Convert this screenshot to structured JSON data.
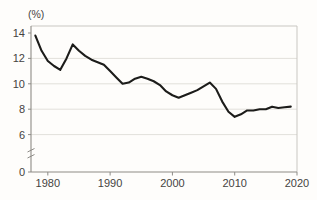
{
  "chart_data": {
    "type": "line",
    "title": "",
    "subtitle": "",
    "xlabel": "",
    "ylabel": "",
    "unit_label": "(%)",
    "grid": true,
    "legend": null,
    "xlim": [
      1977.3,
      2020.0
    ],
    "ylim": [
      5.0,
      14.6
    ],
    "yaxis_break": true,
    "yaxis_break_note": "axis broken between 0 and 6",
    "y_ticks": [
      0,
      6,
      8,
      10,
      12,
      14
    ],
    "y_tick_labels": [
      "0",
      "6",
      "8",
      "10",
      "12",
      "14"
    ],
    "x_ticks": [
      1980,
      1990,
      2000,
      2010,
      2020
    ],
    "x_tick_labels": [
      "1980",
      "1990",
      "2000",
      "2010",
      "2020"
    ],
    "series": [
      {
        "name": "rate",
        "color": "#1c1c1a",
        "x": [
          1978,
          1979,
          1980,
          1981,
          1982,
          1983,
          1984,
          1985,
          1986,
          1987,
          1988,
          1989,
          1990,
          1991,
          1992,
          1993,
          1994,
          1995,
          1996,
          1997,
          1998,
          1999,
          2000,
          2001,
          2002,
          2003,
          2004,
          2005,
          2006,
          2007,
          2008,
          2009,
          2010,
          2011,
          2012,
          2013,
          2014,
          2015,
          2016,
          2017,
          2018,
          2019
        ],
        "values": [
          13.8,
          12.6,
          11.8,
          11.4,
          11.1,
          12.0,
          13.1,
          12.6,
          12.2,
          11.9,
          11.7,
          11.5,
          11.0,
          10.5,
          10.0,
          10.1,
          10.4,
          10.55,
          10.4,
          10.2,
          9.9,
          9.4,
          9.1,
          8.9,
          9.1,
          9.3,
          9.5,
          9.8,
          10.1,
          9.6,
          8.6,
          7.8,
          7.4,
          7.6,
          7.9,
          7.9,
          8.0,
          8.0,
          8.2,
          8.1,
          8.15,
          8.2
        ]
      }
    ],
    "colors": {
      "line": "#1c1c1a",
      "grid": "#e2e0db",
      "axis": "#8d8b86",
      "background": "#fefdfb",
      "text": "#45433f"
    }
  }
}
